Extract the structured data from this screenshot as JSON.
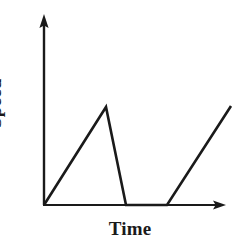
{
  "figure": {
    "name": "speed-time-graph",
    "background_color": "#ffffff",
    "ink_color": "#1a1a1a"
  },
  "axes": {
    "x_label": "Time",
    "y_label": "Speed",
    "origin": {
      "x": 44,
      "y": 205
    },
    "y_axis_tip": {
      "x": 44,
      "y": 15
    },
    "x_axis_tip": {
      "x": 225,
      "y": 205
    },
    "ticks": [],
    "tick_labels": [],
    "grid": false
  },
  "chart_data": {
    "type": "line",
    "title": "",
    "subtitle": "",
    "xlabel": "Time",
    "ylabel": "Speed",
    "xlim": [
      0,
      100
    ],
    "ylim": [
      0,
      100
    ],
    "grid": false,
    "legend": "none",
    "axis_ticks_shown": false,
    "annotations": [],
    "series": [
      {
        "name": "Speed",
        "color": "#1a1a1a",
        "points_px": [
          {
            "x": 44,
            "y": 205
          },
          {
            "x": 106,
            "y": 107
          },
          {
            "x": 126,
            "y": 205
          },
          {
            "x": 167,
            "y": 205
          },
          {
            "x": 231,
            "y": 106
          }
        ],
        "x": [
          0,
          34,
          45,
          68,
          103
        ],
        "values": [
          0,
          51,
          0,
          0,
          52
        ],
        "segments": [
          {
            "label": "accelerating",
            "from": 0,
            "to": 34,
            "slope": "positive"
          },
          {
            "label": "decelerating",
            "from": 34,
            "to": 45,
            "slope": "negative-steep"
          },
          {
            "label": "at rest",
            "from": 45,
            "to": 68,
            "slope": "zero"
          },
          {
            "label": "accelerating",
            "from": 68,
            "to": 103,
            "slope": "positive"
          }
        ]
      }
    ]
  }
}
